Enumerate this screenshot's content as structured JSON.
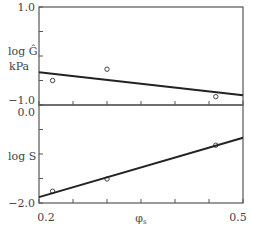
{
  "chart_data": [
    {
      "type": "scatter",
      "title": "",
      "xlabel": "φs",
      "ylabel": "log Ĝ kPa",
      "ylabel_lines": [
        "log Ĝ",
        "kPa"
      ],
      "xlim": [
        0.2,
        0.5
      ],
      "ylim": [
        -1.0,
        1.0
      ],
      "x_ticks": [
        0.2,
        0.25,
        0.3,
        0.35,
        0.4,
        0.45,
        0.5
      ],
      "y_ticks": [
        -1.0,
        -0.5,
        0.0,
        0.5,
        1.0
      ],
      "y_tick_labels": [
        "−1.0",
        "1.0"
      ],
      "grid": false,
      "series": [
        {
          "name": "data",
          "x": [
            0.22,
            0.3,
            0.46
          ],
          "y": [
            -0.5,
            -0.27,
            -0.83
          ],
          "marker": "open-circle"
        },
        {
          "name": "fit",
          "type": "line",
          "x": [
            0.2,
            0.5
          ],
          "y": [
            -0.33,
            -0.8
          ]
        }
      ]
    },
    {
      "type": "scatter",
      "title": "",
      "xlabel": "φs",
      "ylabel": "log S",
      "xlim": [
        0.2,
        0.5
      ],
      "ylim": [
        -2.0,
        0.0
      ],
      "x_ticks": [
        0.2,
        0.25,
        0.3,
        0.35,
        0.4,
        0.45,
        0.5
      ],
      "x_tick_labels": [
        "0.2",
        "0.5"
      ],
      "y_ticks": [
        -2.0,
        -1.5,
        -1.0,
        -0.5,
        0.0
      ],
      "y_tick_labels": [
        "−2.0",
        "0.0"
      ],
      "grid": false,
      "series": [
        {
          "name": "data",
          "x": [
            0.22,
            0.3,
            0.46
          ],
          "y": [
            -1.76,
            -1.51,
            -0.82
          ],
          "marker": "open-circle"
        },
        {
          "name": "fit",
          "type": "line",
          "x": [
            0.2,
            0.5
          ],
          "y": [
            -1.88,
            -0.67
          ]
        }
      ]
    }
  ],
  "labels": {
    "top_y_max": "1.0",
    "top_y_min": "−1.0",
    "top_ylabel_1": "log Ĝ",
    "top_ylabel_2": "kPa",
    "bottom_y_max": "0.0",
    "bottom_y_min": "−2.0",
    "bottom_ylabel": "log S",
    "x_min": "0.2",
    "x_max": "0.5",
    "xlabel": "φs"
  }
}
